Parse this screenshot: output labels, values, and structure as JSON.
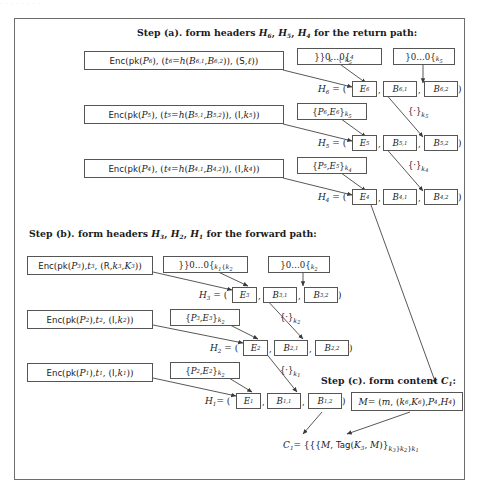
{
  "figure": {
    "ghost_top_text": "· ·   · ·  ·                                            ·                          · ·",
    "steps": {
      "a_heading": "Step (a). form headers H6, H5, H4 for the return path:",
      "b_heading": "Step (b). form headers H3, H2, H1 for the forward path:",
      "c_heading": "Step (c). form content C1:"
    },
    "step_a": {
      "rows": [
        {
          "enc": "Enc(pk(P6), (t6 = h(B6,1, B6,2)), (S, ℓ))",
          "pad_left": "}}0...0{k4{k5",
          "pad_right": "}0...0{k5",
          "header_label": "H6 =",
          "cells": [
            "E6",
            "B6,1",
            "B6,2"
          ]
        },
        {
          "enc": "Enc(pk(P5), (t5 = h(B5,1, B5,2)), (I, k5))",
          "pad_left": "{P6, E6}k5",
          "pad_right": "{·}k5",
          "header_label": "H5 =",
          "cells": [
            "E5",
            "B5,1",
            "B5,2"
          ]
        },
        {
          "enc": "Enc(pk(P4), (t4 = h(B4,1, B4,2)), (I, k4))",
          "pad_left": "{P5, E5}k4",
          "pad_right": "{·}k4",
          "header_label": "H4 =",
          "cells": [
            "E4",
            "B4,1",
            "B4,2"
          ]
        }
      ]
    },
    "step_b": {
      "rows": [
        {
          "enc": "Enc(pk(P3), t3, (R, k3, K3))",
          "pad_left": "}}0...0{k1{k2",
          "pad_right": "}0...0{k2",
          "header_label": "H3 =",
          "cells": [
            "E3",
            "B3,1",
            "B3,2"
          ]
        },
        {
          "enc": "Enc(pk(P2), t2, (I, k2))",
          "pad_left": "{P3, E3}k2",
          "pad_right": "{·}k2",
          "header_label": "H2 =",
          "cells": [
            "E2",
            "B2,1",
            "B2,2"
          ]
        },
        {
          "enc": "Enc(pk(P1), t1, (I, k1))",
          "pad_left": "{P2, E2}k2",
          "pad_right": "{·}k1",
          "header_label": "H1 =",
          "cells": [
            "E1",
            "B1,1",
            "B1,2"
          ]
        }
      ]
    },
    "step_c": {
      "message_box": "M = (m, (k6, K6), P4, H4)",
      "content_label": "C1 =",
      "content_formula": "{{{M, Tag(K3, M)}k3}k2}k1"
    },
    "colors": {
      "frame_border": "#6d6d6d",
      "box_border": "#555555",
      "text": "#1a1a1a",
      "background": "#ffffff"
    }
  }
}
